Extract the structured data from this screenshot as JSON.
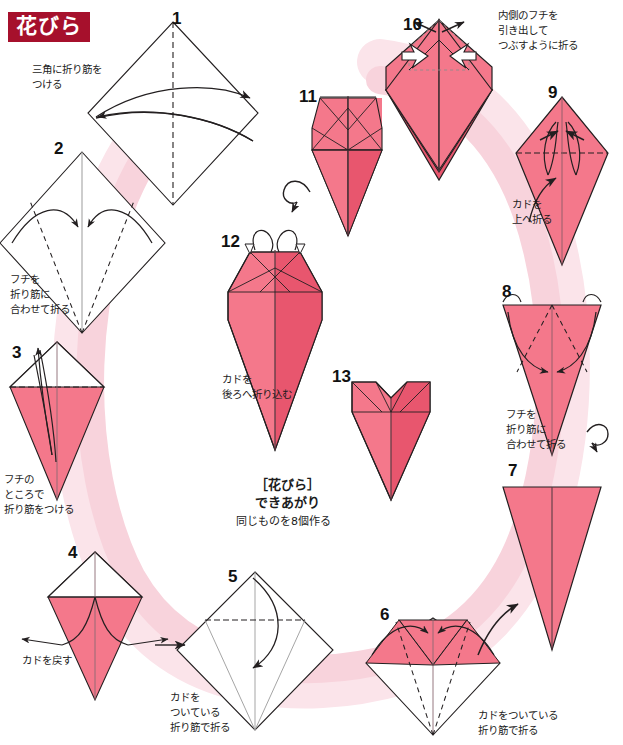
{
  "title": "花びら",
  "colors": {
    "title_bg": "#a6102c",
    "title_text": "#ffffff",
    "paper_front": "#f4788b",
    "paper_front_dark": "#e8566e",
    "paper_back": "#ffffff",
    "flow_path": "#f8d3dc",
    "flow_path_light": "#fbe4ea",
    "line": "#231f20",
    "text": "#1b1b1b"
  },
  "steps": [
    {
      "number": "1",
      "caption": "三角に折り筋を\nつける",
      "shape": "square-diamond",
      "num_pos": {
        "x": 172,
        "y": 10
      },
      "cap_pos": {
        "x": 32,
        "y": 62
      }
    },
    {
      "number": "2",
      "caption": "フチを\n折り筋に\n合わせて折る",
      "shape": "diamond-with-creases",
      "num_pos": {
        "x": 54,
        "y": 140
      },
      "cap_pos": {
        "x": 10,
        "y": 272
      }
    },
    {
      "number": "3",
      "caption": "フチの\nところで\n折り筋をつける",
      "shape": "kite-pink",
      "num_pos": {
        "x": 12,
        "y": 344
      },
      "cap_pos": {
        "x": 4,
        "y": 472
      }
    },
    {
      "number": "4",
      "caption": "カドを戻す",
      "shape": "kite-open",
      "num_pos": {
        "x": 68,
        "y": 544
      },
      "cap_pos": {
        "x": 22,
        "y": 653
      }
    },
    {
      "number": "5",
      "caption": "カドを\nついている\n折り筋で折る",
      "shape": "diamond-flat",
      "num_pos": {
        "x": 228,
        "y": 568
      },
      "cap_pos": {
        "x": 170,
        "y": 690
      }
    },
    {
      "number": "6",
      "caption": "カドをついている\n折り筋で折る",
      "shape": "folded-top",
      "num_pos": {
        "x": 380,
        "y": 606
      },
      "cap_pos": {
        "x": 478,
        "y": 708
      }
    },
    {
      "number": "7",
      "caption": "フチを\n折り筋に\n合わせて折る",
      "shape": "triangle-pink",
      "num_pos": {
        "x": 508,
        "y": 462
      },
      "cap_pos": {
        "x": 506,
        "y": 420
      }
    },
    {
      "number": "8",
      "caption": "フチを\n折り筋に\n合わせて折る",
      "shape": "triangle-creases",
      "num_pos": {
        "x": 502,
        "y": 283
      },
      "cap_pos": {
        "x": 506,
        "y": 410
      }
    },
    {
      "number": "9",
      "caption": "カドを\n上へ折る",
      "shape": "narrow-kite",
      "num_pos": {
        "x": 548,
        "y": 84
      },
      "cap_pos": {
        "x": 512,
        "y": 197
      }
    },
    {
      "number": "10",
      "caption": "内側のフチを\n引き出して\nつぶすように折る",
      "shape": "wide-top-kite",
      "num_pos": {
        "x": 403,
        "y": 16
      },
      "cap_pos": {
        "x": 498,
        "y": 8
      }
    },
    {
      "number": "11",
      "caption": "",
      "shape": "petal-three-points",
      "num_pos": {
        "x": 299,
        "y": 88
      },
      "cap_pos": {
        "x": 0,
        "y": 0
      }
    },
    {
      "number": "12",
      "caption": "カドを\n後ろへ折り込む",
      "shape": "petal-long",
      "num_pos": {
        "x": 221,
        "y": 233
      },
      "cap_pos": {
        "x": 222,
        "y": 372
      }
    },
    {
      "number": "13",
      "caption": "",
      "shape": "petal-finished",
      "num_pos": {
        "x": 332,
        "y": 368
      },
      "cap_pos": {
        "x": 0,
        "y": 0
      }
    }
  ],
  "final_note": {
    "heading": "［花びら］\nできあがり",
    "subtext": "同じものを8個作る",
    "heading_pos": {
      "x": 255,
      "y": 478
    },
    "subtext_pos": {
      "x": 236,
      "y": 514
    }
  },
  "symbols": {
    "turn_over_1": "turn-over-arrow",
    "turn_over_2": "turn-over-arrow",
    "flow_arrow_bottom_right": "flow-arrow",
    "flow_arrow_bottom_left": "flow-arrow"
  }
}
